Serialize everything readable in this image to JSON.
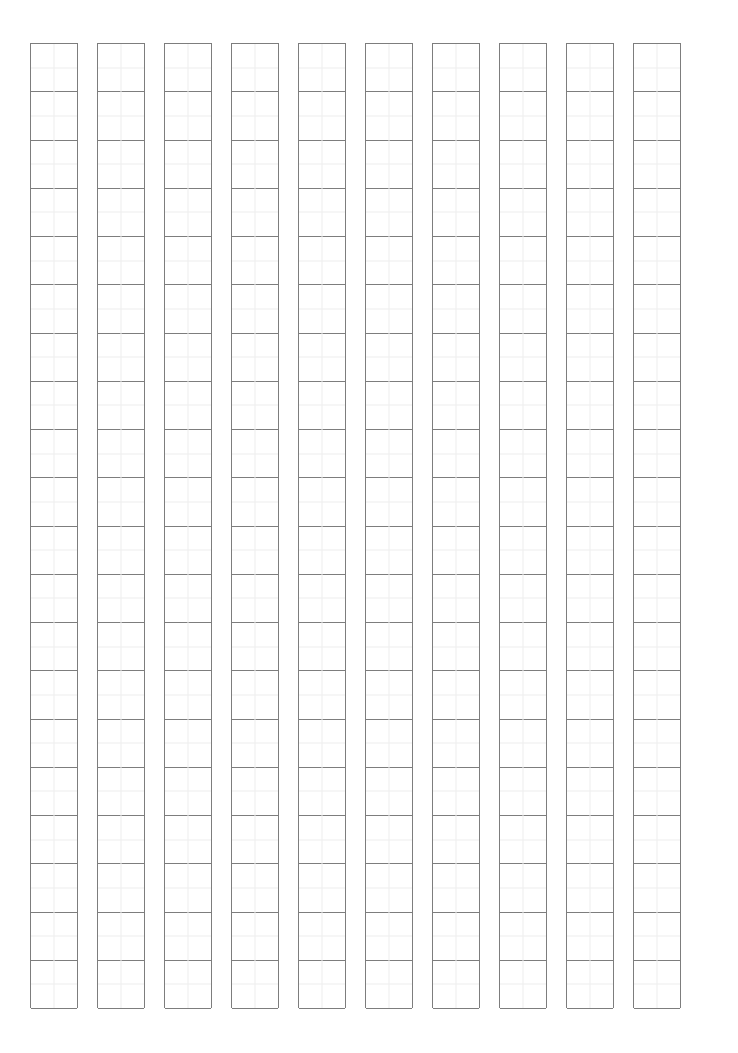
{
  "page": {
    "kind": "manuscript-grid-paper",
    "orientation": "portrait",
    "width_px": 738,
    "height_px": 1053,
    "background_color": "#ffffff",
    "content_text": "",
    "title_text": "",
    "header_text": "",
    "footer_text": "",
    "page_number_text": ""
  },
  "grid": {
    "columns": 10,
    "rows_per_column": 20,
    "column_width_px": 48,
    "column_pitch_px": 67,
    "cell_height_px": 48.25,
    "origin_x_px": 30,
    "origin_y_px": 43,
    "grid_width_px": 676,
    "grid_height_px": 965,
    "major_line_color": "#7d7d7d",
    "major_line_width_px": 1,
    "minor_line_color": "#ededed",
    "minor_line_width_px": 1,
    "border_color": "#7d7d7d",
    "cell_fill_color": "#ffffff",
    "has_vertical_midline": true,
    "has_horizontal_midline": true,
    "column_labels": [
      "1",
      "2",
      "3",
      "4",
      "5",
      "6",
      "7",
      "8",
      "9",
      "10"
    ],
    "cell_values": [
      [
        "",
        "",
        "",
        "",
        "",
        "",
        "",
        "",
        "",
        "",
        "",
        "",
        "",
        "",
        "",
        "",
        "",
        "",
        "",
        ""
      ],
      [
        "",
        "",
        "",
        "",
        "",
        "",
        "",
        "",
        "",
        "",
        "",
        "",
        "",
        "",
        "",
        "",
        "",
        "",
        "",
        ""
      ],
      [
        "",
        "",
        "",
        "",
        "",
        "",
        "",
        "",
        "",
        "",
        "",
        "",
        "",
        "",
        "",
        "",
        "",
        "",
        "",
        ""
      ],
      [
        "",
        "",
        "",
        "",
        "",
        "",
        "",
        "",
        "",
        "",
        "",
        "",
        "",
        "",
        "",
        "",
        "",
        "",
        "",
        ""
      ],
      [
        "",
        "",
        "",
        "",
        "",
        "",
        "",
        "",
        "",
        "",
        "",
        "",
        "",
        "",
        "",
        "",
        "",
        "",
        "",
        ""
      ],
      [
        "",
        "",
        "",
        "",
        "",
        "",
        "",
        "",
        "",
        "",
        "",
        "",
        "",
        "",
        "",
        "",
        "",
        "",
        "",
        ""
      ],
      [
        "",
        "",
        "",
        "",
        "",
        "",
        "",
        "",
        "",
        "",
        "",
        "",
        "",
        "",
        "",
        "",
        "",
        "",
        "",
        ""
      ],
      [
        "",
        "",
        "",
        "",
        "",
        "",
        "",
        "",
        "",
        "",
        "",
        "",
        "",
        "",
        "",
        "",
        "",
        "",
        "",
        ""
      ],
      [
        "",
        "",
        "",
        "",
        "",
        "",
        "",
        "",
        "",
        "",
        "",
        "",
        "",
        "",
        "",
        "",
        "",
        "",
        "",
        ""
      ],
      [
        "",
        "",
        "",
        "",
        "",
        "",
        "",
        "",
        "",
        "",
        "",
        "",
        "",
        "",
        "",
        "",
        "",
        "",
        "",
        ""
      ]
    ]
  }
}
